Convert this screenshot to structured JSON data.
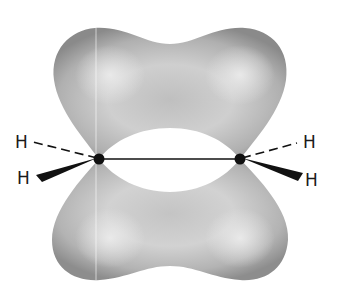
{
  "diagram": {
    "atoms": {
      "carbon_left": {
        "x": 99,
        "y": 159
      },
      "carbon_right": {
        "x": 240,
        "y": 159
      }
    },
    "hydrogen_labels": {
      "top_left": "H",
      "bottom_left": "H",
      "top_right": "H",
      "bottom_right": "H"
    },
    "colors": {
      "lobe_light": "#e4e4e4",
      "lobe_mid": "#bdbdbd",
      "lobe_dark": "#8f8f8f",
      "bond": "#111111",
      "background": "#ffffff"
    }
  }
}
